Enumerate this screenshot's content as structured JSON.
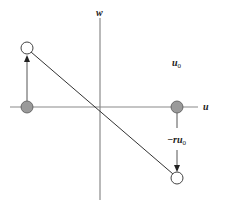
{
  "diagram": {
    "type": "phase-plane",
    "axes": {
      "horizontal": {
        "label": "u"
      },
      "vertical": {
        "label": "w"
      }
    },
    "labels": {
      "u0": {
        "base": "u",
        "subscript": "0"
      },
      "neg_r_u0": {
        "prefix": "−r",
        "base": "u",
        "subscript": "0"
      }
    },
    "points": [
      {
        "id": "left-start",
        "style": "filled-grey"
      },
      {
        "id": "right-start",
        "style": "filled-grey"
      },
      {
        "id": "upper-left-end",
        "style": "open"
      },
      {
        "id": "lower-right-end",
        "style": "open"
      }
    ],
    "arrows": [
      {
        "from": "left-start",
        "to": "upper-left-end",
        "direction": "up"
      },
      {
        "from": "right-start",
        "to": "lower-right-end",
        "direction": "down"
      }
    ],
    "lines": [
      {
        "from": "upper-left-end",
        "to": "lower-right-end",
        "kind": "diagonal-through-origin"
      }
    ],
    "colors": {
      "axis": "#8a8a8a",
      "line": "#333333",
      "filled_point": "#9a9a9a",
      "point_stroke": "#444444",
      "text": "#222222"
    }
  }
}
